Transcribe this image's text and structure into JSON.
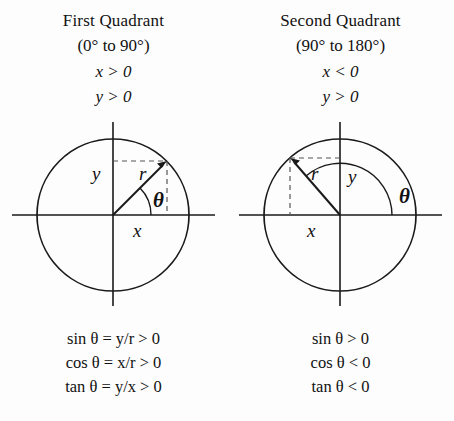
{
  "quadrants": [
    {
      "title": "First Quadrant",
      "range": "(0° to 90°)",
      "cond_x": "x > 0",
      "cond_y": "y > 0",
      "labels": {
        "r": "r",
        "x": "x",
        "y": "y",
        "theta": "θ"
      },
      "formulas": [
        "sin θ = y/r > 0",
        "cos θ = x/r > 0",
        "tan θ = y/x > 0"
      ]
    },
    {
      "title": "Second Quadrant",
      "range": "(90° to 180°)",
      "cond_x": "x < 0",
      "cond_y": "y > 0",
      "labels": {
        "r": "r",
        "x": "x",
        "y": "y",
        "theta": "θ"
      },
      "formulas": [
        "sin θ > 0",
        "cos θ < 0",
        "tan θ < 0"
      ]
    }
  ],
  "colors": {
    "background": "#fdfdfd",
    "ink": "#1a1a1a",
    "dashed": "#555555"
  }
}
